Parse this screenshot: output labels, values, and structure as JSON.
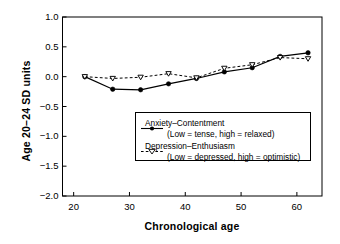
{
  "chart_data": {
    "type": "line",
    "title": "",
    "xlabel": "Chronological age",
    "ylabel": "Age 20–24 SD units",
    "x": [
      22,
      27,
      32,
      37,
      42,
      47,
      52,
      57,
      62
    ],
    "xlim": [
      18,
      64.5
    ],
    "ylim": [
      -2.0,
      1.0
    ],
    "xticks": [
      "20",
      "30",
      "40",
      "50",
      "60"
    ],
    "xtick_values": [
      20,
      30,
      40,
      50,
      60
    ],
    "yticks": [
      "1.0",
      "0.5",
      "0.0",
      "−0.5",
      "−1.0",
      "−1.5",
      "−2.0"
    ],
    "ytick_values": [
      1.0,
      0.5,
      0.0,
      -0.5,
      -1.0,
      -1.5,
      -2.0
    ],
    "grid": false,
    "legend_position": "center-right",
    "series": [
      {
        "name": "Anxiety–Contentment",
        "description": "(Low = tense, high = relaxed)",
        "marker": "filled-circle",
        "line_style": "solid",
        "color": "#000000",
        "values": [
          0.0,
          -0.21,
          -0.22,
          -0.12,
          -0.03,
          0.08,
          0.15,
          0.34,
          0.4
        ]
      },
      {
        "name": "Depression–Enthusiasm",
        "description": "(Low = depressed, high = optimistic)",
        "marker": "open-triangle-down",
        "line_style": "dashed",
        "color": "#000000",
        "values": [
          0.0,
          -0.03,
          -0.01,
          0.05,
          -0.02,
          0.14,
          0.2,
          0.32,
          0.3
        ]
      }
    ]
  },
  "legend": {
    "items": [
      {
        "label": "Anxiety–Contentment",
        "sub": "(Low = tense, high = relaxed)"
      },
      {
        "label": "Depression–Enthusiasm",
        "sub": "(Low = depressed, high = optimistic)"
      }
    ]
  },
  "axes": {
    "x_title": "Chronological age",
    "y_title": "Age 20–24 SD units"
  }
}
